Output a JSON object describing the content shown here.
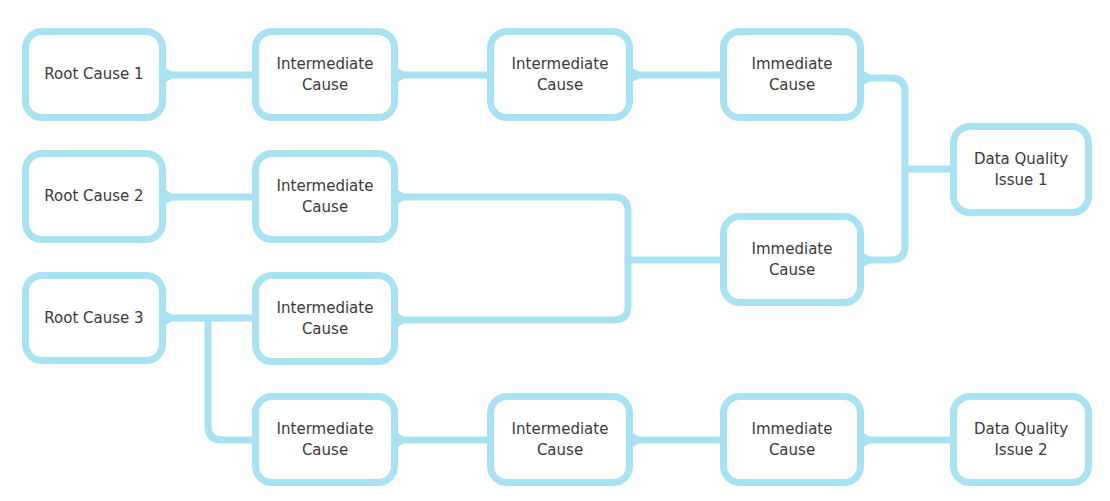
{
  "diagram": {
    "type": "root-cause-tree",
    "accent_color": "#a9e3f2",
    "text_color": "#3a3a3a",
    "nodes": [
      {
        "id": "rc1",
        "label": "Root Cause 1",
        "x": 22,
        "y": 28,
        "w": 144,
        "h": 93
      },
      {
        "id": "rc2",
        "label": "Root Cause 2",
        "x": 22,
        "y": 150,
        "w": 144,
        "h": 93
      },
      {
        "id": "rc3",
        "label": "Root Cause 3",
        "x": 22,
        "y": 272,
        "w": 144,
        "h": 92
      },
      {
        "id": "ic1a",
        "label": "Intermediate\nCause",
        "x": 252,
        "y": 28,
        "w": 146,
        "h": 93
      },
      {
        "id": "ic2",
        "label": "Intermediate\nCause",
        "x": 252,
        "y": 150,
        "w": 146,
        "h": 93
      },
      {
        "id": "ic3",
        "label": "Intermediate\nCause",
        "x": 252,
        "y": 272,
        "w": 146,
        "h": 93
      },
      {
        "id": "ic4",
        "label": "Intermediate\nCause",
        "x": 252,
        "y": 393,
        "w": 146,
        "h": 93
      },
      {
        "id": "ic1b",
        "label": "Intermediate\nCause",
        "x": 487,
        "y": 28,
        "w": 146,
        "h": 93
      },
      {
        "id": "ic5",
        "label": "Intermediate\nCause",
        "x": 487,
        "y": 393,
        "w": 146,
        "h": 93
      },
      {
        "id": "im1",
        "label": "Immediate\nCause",
        "x": 720,
        "y": 28,
        "w": 144,
        "h": 93
      },
      {
        "id": "im2",
        "label": "Immediate\nCause",
        "x": 720,
        "y": 213,
        "w": 144,
        "h": 93
      },
      {
        "id": "im3",
        "label": "Immediate\nCause",
        "x": 720,
        "y": 393,
        "w": 144,
        "h": 93
      },
      {
        "id": "dq1",
        "label": "Data Quality\nIssue 1",
        "x": 950,
        "y": 123,
        "w": 142,
        "h": 93
      },
      {
        "id": "dq2",
        "label": "Data Quality\nIssue 2",
        "x": 950,
        "y": 393,
        "w": 142,
        "h": 93
      }
    ],
    "edges": [
      {
        "from": "ic1a",
        "to": "rc1"
      },
      {
        "from": "ic1b",
        "to": "ic1a"
      },
      {
        "from": "im1",
        "to": "ic1b"
      },
      {
        "from": "dq1",
        "to": "im1"
      },
      {
        "from": "dq1",
        "to": "im2"
      },
      {
        "from": "ic2",
        "to": "rc2"
      },
      {
        "from": "im2",
        "to": "ic2"
      },
      {
        "from": "im2",
        "to": "ic3"
      },
      {
        "from": "ic3",
        "to": "rc3"
      },
      {
        "from": "ic4",
        "to": "rc3"
      },
      {
        "from": "ic5",
        "to": "ic4"
      },
      {
        "from": "im3",
        "to": "ic5"
      },
      {
        "from": "dq2",
        "to": "im3"
      }
    ]
  }
}
